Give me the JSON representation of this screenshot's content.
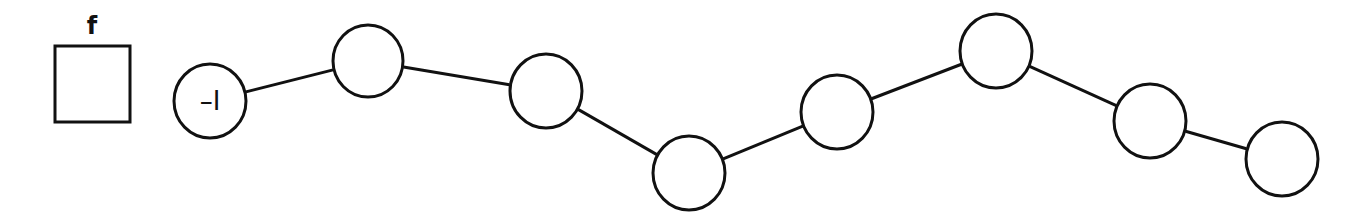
{
  "diagram": {
    "box": {
      "label": "f",
      "x": 55,
      "y": 46,
      "width": 75,
      "height": 76,
      "label_x": 92,
      "label_y": 34
    },
    "nodes": [
      {
        "id": "n1",
        "cx": 210,
        "cy": 101,
        "r": 37,
        "label": "–I"
      },
      {
        "id": "n2",
        "cx": 368,
        "cy": 61,
        "r": 36,
        "label": ""
      },
      {
        "id": "n3",
        "cx": 546,
        "cy": 91,
        "r": 37,
        "label": ""
      },
      {
        "id": "n4",
        "cx": 689,
        "cy": 173,
        "r": 37,
        "label": ""
      },
      {
        "id": "n5",
        "cx": 837,
        "cy": 112,
        "r": 37,
        "label": ""
      },
      {
        "id": "n6",
        "cx": 996,
        "cy": 51,
        "r": 37,
        "label": ""
      },
      {
        "id": "n7",
        "cx": 1150,
        "cy": 121,
        "r": 37,
        "label": ""
      },
      {
        "id": "n8",
        "cx": 1282,
        "cy": 159,
        "r": 37,
        "label": ""
      }
    ],
    "edges": [
      [
        "n1",
        "n2"
      ],
      [
        "n2",
        "n3"
      ],
      [
        "n3",
        "n4"
      ],
      [
        "n4",
        "n5"
      ],
      [
        "n5",
        "n6"
      ],
      [
        "n6",
        "n7"
      ],
      [
        "n7",
        "n8"
      ]
    ],
    "colors": {
      "stroke": "#111111",
      "background": "#ffffff"
    }
  }
}
